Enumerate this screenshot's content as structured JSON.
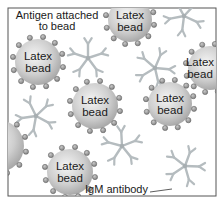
{
  "diagram": {
    "frame": {
      "x": 8,
      "y": 8,
      "width": 208,
      "height": 188,
      "stroke": "#555555"
    },
    "colors": {
      "bead_light": "#f2f2f2",
      "bead_dark": "#a9a9a9",
      "antigen_fill": "#9b9b9b",
      "antigen_stroke": "#5a5a5a",
      "antibody": "#b5bcbf",
      "text": "#1a1a1a"
    },
    "labels": {
      "antigen": "Antigen attached",
      "antigen_line2": "to bead",
      "igm": "IgM antibody"
    },
    "beads": [
      {
        "cx": 38,
        "cy": 62,
        "r": 23,
        "line1": "Latex",
        "line2": "bead"
      },
      {
        "cx": 130,
        "cy": 20,
        "r": 22,
        "line1": "Latex",
        "line2": "bead"
      },
      {
        "cx": 210,
        "cy": 68,
        "r": 22,
        "line1": "Latex",
        "line2": "bead"
      },
      {
        "cx": 95,
        "cy": 106,
        "r": 23,
        "line1": "Latex",
        "line2": "bead"
      },
      {
        "cx": 170,
        "cy": 104,
        "r": 22,
        "line1": "Latex",
        "line2": "bead"
      },
      {
        "cx": 70,
        "cy": 172,
        "r": 23,
        "line1": "Latex",
        "line2": "bead"
      },
      {
        "cx": -2,
        "cy": 146,
        "r": 26,
        "line1": "",
        "line2": ""
      }
    ],
    "antibodies": [
      {
        "cx": 88,
        "cy": 58
      },
      {
        "cx": 155,
        "cy": 68
      },
      {
        "cx": 36,
        "cy": 116
      },
      {
        "cx": 122,
        "cy": 146
      },
      {
        "cx": 185,
        "cy": 166
      },
      {
        "cx": 184,
        "cy": 16
      }
    ]
  }
}
